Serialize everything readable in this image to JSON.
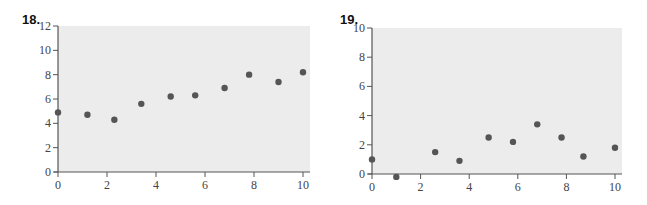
{
  "figures": [
    {
      "number": "18."
    },
    {
      "number": "19."
    }
  ],
  "colors": {
    "plot_bg": "#ececec",
    "axis": "#555555",
    "point": "#555555"
  },
  "chart_data": [
    {
      "type": "scatter",
      "title": "18.",
      "xlabel": "",
      "ylabel": "",
      "xlim": [
        0,
        10.5
      ],
      "ylim": [
        0,
        12
      ],
      "xticks": [
        0,
        2,
        4,
        6,
        8,
        10
      ],
      "yticks": [
        0,
        2,
        4,
        6,
        8,
        10,
        12
      ],
      "grid": false,
      "legend": null,
      "x": [
        0,
        1.2,
        2.3,
        3.4,
        4.6,
        5.6,
        6.8,
        7.8,
        9.0,
        10.0
      ],
      "y": [
        4.9,
        4.7,
        4.3,
        5.6,
        6.2,
        6.3,
        6.9,
        8.0,
        7.4,
        8.2
      ]
    },
    {
      "type": "scatter",
      "title": "19.",
      "xlabel": "",
      "ylabel": "",
      "xlim": [
        0,
        10.5
      ],
      "ylim": [
        0,
        10
      ],
      "xticks": [
        0,
        2,
        4,
        6,
        8,
        10
      ],
      "yticks": [
        0,
        2,
        4,
        6,
        8,
        10
      ],
      "grid": false,
      "legend": null,
      "x": [
        0,
        1.0,
        2.6,
        3.6,
        4.8,
        5.8,
        6.8,
        7.8,
        8.7,
        10.0
      ],
      "y": [
        1.0,
        -0.2,
        1.5,
        0.9,
        2.5,
        2.2,
        3.4,
        2.5,
        1.2,
        1.8
      ]
    }
  ]
}
